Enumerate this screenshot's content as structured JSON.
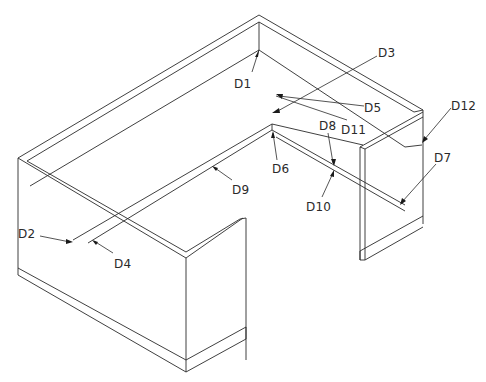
{
  "drawing": {
    "view": "isometric",
    "subject": "U-shaped desk / workstation assembly",
    "line_color": "#2a2a2a",
    "background": "#ffffff"
  },
  "labels": [
    {
      "id": "D1",
      "text": "D1",
      "x": 234,
      "y": 78
    },
    {
      "id": "D2",
      "text": "D2",
      "x": 18,
      "y": 232
    },
    {
      "id": "D3",
      "text": "D3",
      "x": 378,
      "y": 48
    },
    {
      "id": "D4",
      "text": "D4",
      "x": 114,
      "y": 258
    },
    {
      "id": "D5",
      "text": "D5",
      "x": 364,
      "y": 102
    },
    {
      "id": "D6",
      "text": "D6",
      "x": 272,
      "y": 164
    },
    {
      "id": "D7",
      "text": "D7",
      "x": 434,
      "y": 152
    },
    {
      "id": "D8",
      "text": "D8",
      "x": 319,
      "y": 121
    },
    {
      "id": "D9",
      "text": "D9",
      "x": 232,
      "y": 184
    },
    {
      "id": "D10",
      "text": "D10",
      "x": 306,
      "y": 200
    },
    {
      "id": "D11",
      "text": "D11",
      "x": 341,
      "y": 124
    },
    {
      "id": "D12",
      "text": "D12",
      "x": 451,
      "y": 100
    }
  ]
}
